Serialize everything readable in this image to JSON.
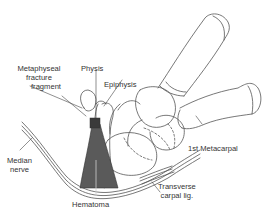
{
  "diagram": {
    "type": "anatomical-illustration",
    "colors": {
      "line": "#555555",
      "hematoma": "#5a5a5a",
      "background": "#ffffff"
    },
    "labels": {
      "metaphyseal_line1": "Metaphyseal",
      "metaphyseal_line2": "fracture",
      "metaphyseal_line3": "fragment",
      "physis": "Physis",
      "epiphysis": "Epiphysis",
      "median_line1": "Median",
      "median_line2": "nerve",
      "hematoma": "Hematoma",
      "first_metacarpal": "1st Metacarpal",
      "transverse_line1": "Transverse",
      "transverse_line2": "carpal lig."
    }
  }
}
